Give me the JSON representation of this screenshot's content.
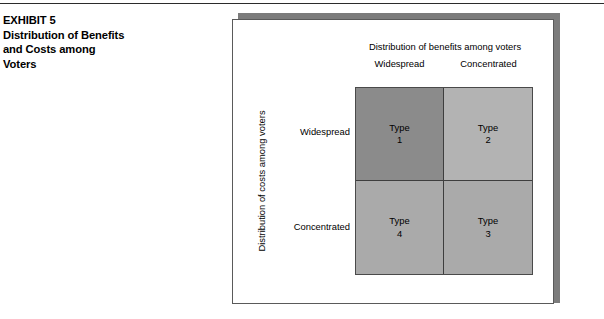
{
  "exhibit": {
    "caption_lines": [
      "EXHIBIT 5",
      "Distribution of Benefits",
      "and Costs among",
      "Voters"
    ]
  },
  "figure": {
    "column_axis_title": "Distribution of benefits among voters",
    "column_labels": [
      "Widespread",
      "Concentrated"
    ],
    "row_axis_title": "Distribution of costs among voters",
    "row_labels": [
      "Widespread",
      "Concentrated"
    ]
  },
  "chart_data": {
    "type": "table",
    "title": "Distribution of Benefits and Costs among Voters",
    "xlabel": "Distribution of benefits among voters",
    "ylabel": "Distribution of costs among voters",
    "categories_x": [
      "Widespread",
      "Concentrated"
    ],
    "categories_y": [
      "Widespread",
      "Concentrated"
    ],
    "cells": [
      {
        "row": "Widespread",
        "col": "Widespread",
        "word": "Type",
        "number": "1",
        "fill": "#8b8b8b"
      },
      {
        "row": "Widespread",
        "col": "Concentrated",
        "word": "Type",
        "number": "2",
        "fill": "#b3b3b3"
      },
      {
        "row": "Concentrated",
        "col": "Widespread",
        "word": "Type",
        "number": "4",
        "fill": "#aaaaaa"
      },
      {
        "row": "Concentrated",
        "col": "Concentrated",
        "word": "Type",
        "number": "3",
        "fill": "#aaaaaa"
      }
    ],
    "grid": true,
    "legend": "none"
  },
  "colors": {
    "rule": "#2b2b2b",
    "panel_border": "#5a5a5a",
    "panel_shadow": "#7c7c7c",
    "matrix_border": "#4a4a4a",
    "quadrant_dark": "#8b8b8b",
    "quadrant_light": "#b3b3b3",
    "quadrant_mid": "#aaaaaa"
  }
}
